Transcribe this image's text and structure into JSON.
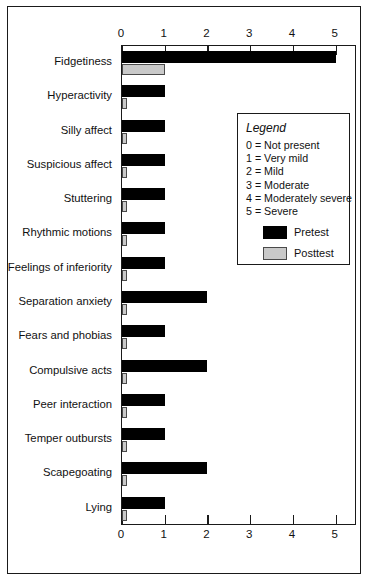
{
  "chart_data": {
    "type": "bar",
    "orientation": "horizontal",
    "title": "",
    "xlabel": "",
    "ylabel": "",
    "xlim": [
      0,
      5.5
    ],
    "xticks": [
      0,
      1,
      2,
      3,
      4,
      5
    ],
    "xtick_labels": [
      "0",
      "1",
      "2",
      "3",
      "4",
      "5"
    ],
    "grid": false,
    "axis_top_labels": true,
    "axis_bottom_labels": true,
    "categories": [
      "Fidgetiness",
      "Hyperactivity",
      "Silly affect",
      "Suspicious affect",
      "Stuttering",
      "Rhythmic motions",
      "Feelings of inferiority",
      "Separation anxiety",
      "Fears and phobias",
      "Compulsive acts",
      "Peer interaction",
      "Temper outbursts",
      "Scapegoating",
      "Lying"
    ],
    "series": [
      {
        "name": "Pretest",
        "color": "#000000",
        "values": [
          5,
          1,
          1,
          1,
          1,
          1,
          1,
          2,
          1,
          2,
          1,
          1,
          2,
          1
        ]
      },
      {
        "name": "Posttest",
        "color": "#c9c9c9",
        "values": [
          1,
          0.1,
          0.1,
          0.1,
          0.1,
          0.12,
          0.12,
          0.1,
          0.1,
          0.1,
          0.1,
          0.1,
          0.12,
          0.1
        ]
      }
    ],
    "legend": {
      "position": "inside-right",
      "title": "Legend",
      "scale": [
        "0 = Not present",
        "1 = Very mild",
        "2 = Mild",
        "3 = Moderate",
        "4 = Moderately severe",
        "5 = Severe"
      ],
      "series_labels": [
        "Pretest",
        "Posttest"
      ]
    }
  }
}
